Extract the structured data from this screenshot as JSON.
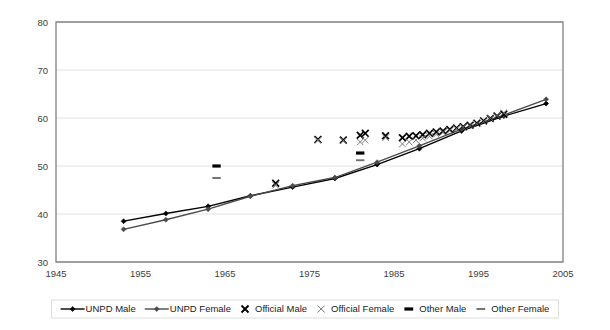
{
  "chart_data": {
    "type": "line",
    "title": "",
    "xlabel": "",
    "ylabel": "",
    "xlim": [
      1945,
      2005
    ],
    "ylim": [
      30,
      80
    ],
    "xticks": [
      1945,
      1955,
      1965,
      1975,
      1985,
      1995,
      2005
    ],
    "yticks": [
      30,
      40,
      50,
      60,
      70,
      80
    ],
    "grid": "horizontal",
    "legend_position": "bottom",
    "series": [
      {
        "name": "UNPD Male",
        "marker": "diamond",
        "style": "line-with-markers",
        "color": "#000000",
        "x": [
          1953,
          1958,
          1963,
          1968,
          1973,
          1978,
          1983,
          1988,
          1993,
          1998,
          2003
        ],
        "values": [
          38.5,
          40.1,
          41.6,
          43.8,
          45.6,
          47.4,
          50.3,
          53.6,
          57.3,
          60.4,
          63.0
        ]
      },
      {
        "name": "UNPD Female",
        "marker": "diamond",
        "style": "line-with-markers",
        "color": "#4a4a4a",
        "x": [
          1953,
          1958,
          1963,
          1968,
          1973,
          1978,
          1983,
          1988,
          1993,
          1998,
          2003
        ],
        "values": [
          36.8,
          38.8,
          41.0,
          43.7,
          45.9,
          47.6,
          50.8,
          54.2,
          57.7,
          60.6,
          63.9
        ]
      },
      {
        "name": "Official Male",
        "marker": "cross-bold",
        "style": "markers-only",
        "color": "#000000",
        "x": [
          1971,
          1976,
          1979,
          1981,
          1981.6,
          1984,
          1986,
          1986.8,
          1987.6,
          1988.4,
          1989.2,
          1990,
          1990.8,
          1991.6,
          1992.4,
          1993.2,
          1994,
          1994.8,
          1995.6,
          1996.4,
          1997.2,
          1998
        ],
        "values": [
          46.4,
          55.5,
          55.4,
          56.4,
          56.8,
          56.3,
          55.9,
          56.2,
          56.3,
          56.5,
          56.8,
          57.1,
          57.3,
          57.6,
          57.9,
          58.2,
          58.5,
          58.9,
          59.4,
          59.9,
          60.4,
          60.8
        ]
      },
      {
        "name": "Official Female",
        "marker": "cross-light",
        "style": "markers-only",
        "color": "#6e6e6e",
        "x": [
          1971,
          1976,
          1979,
          1981,
          1981.6,
          1984,
          1986,
          1986.8,
          1987.6,
          1988.4,
          1989.2,
          1990,
          1990.8,
          1991.6,
          1992.4,
          1993.2,
          1994,
          1994.8,
          1995.6,
          1996.4,
          1997.2,
          1998
        ],
        "values": [
          46.0,
          55.4,
          55.3,
          55.0,
          55.4,
          55.9,
          54.6,
          55.0,
          55.4,
          55.8,
          56.2,
          56.6,
          57.0,
          57.4,
          57.8,
          58.1,
          58.4,
          58.8,
          59.3,
          59.9,
          60.5,
          61.1
        ]
      },
      {
        "name": "Other Male",
        "marker": "dash-bold",
        "style": "markers-only",
        "color": "#000000",
        "x": [
          1964,
          1981
        ],
        "values": [
          50.0,
          52.7
        ]
      },
      {
        "name": "Other Female",
        "marker": "dash-light",
        "style": "markers-only",
        "color": "#6e6e6e",
        "x": [
          1964,
          1981
        ],
        "values": [
          47.5,
          51.2
        ]
      }
    ]
  },
  "legend": {
    "entries": [
      {
        "label": "UNPD Male",
        "marker": "line-diamond-dark"
      },
      {
        "label": "UNPD Female",
        "marker": "line-diamond-gray"
      },
      {
        "label": "Official Male",
        "marker": "cross-bold"
      },
      {
        "label": "Official Female",
        "marker": "cross-light"
      },
      {
        "label": "Other Male",
        "marker": "dash-bold"
      },
      {
        "label": "Other Female",
        "marker": "dash-light"
      }
    ]
  },
  "colors": {
    "series_dark": "#000000",
    "series_gray": "#4a4a4a",
    "marker_gray": "#6e6e6e",
    "grid": "#d9d9d9",
    "axis": "#808080",
    "tick_text": "#404040"
  }
}
